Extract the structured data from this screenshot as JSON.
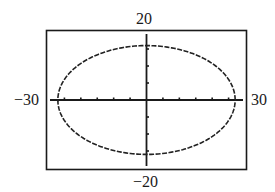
{
  "chart_data": {
    "type": "line",
    "title": "",
    "xlabel": "",
    "ylabel": "",
    "xlim": [
      -30,
      30
    ],
    "ylim": [
      -20,
      20
    ],
    "xscale": 5,
    "yscale": 5,
    "grid": false,
    "legend": null,
    "tick_labels": {
      "xmin": "−30",
      "xmax": "30",
      "ymin": "−20",
      "ymax": "20"
    },
    "series": [
      {
        "name": "ellipse",
        "equation": "x^2/27^2 + y^2/16^2 = 1",
        "center": [
          0,
          0
        ],
        "semi_axis_x": 27,
        "semi_axis_y": 16,
        "color": "#222222"
      }
    ]
  },
  "labels": {
    "ymax": "20",
    "ymin": "−20",
    "xmin": "−30",
    "xmax": "30"
  }
}
